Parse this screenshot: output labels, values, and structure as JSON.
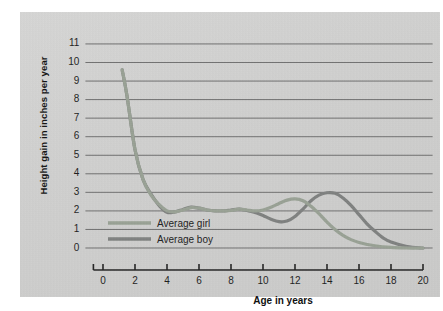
{
  "chart_data": {
    "type": "line",
    "title": "",
    "xlabel": "Age in years",
    "ylabel": "Height gain in inches per year",
    "xlim": [
      -1,
      20
    ],
    "ylim": [
      0,
      11
    ],
    "xticks": [
      "0",
      "2",
      "4",
      "6",
      "8",
      "10",
      "12",
      "14",
      "16",
      "18",
      "20"
    ],
    "yticks": [
      "0",
      "1",
      "2",
      "3",
      "4",
      "5",
      "6",
      "7",
      "8",
      "9",
      "10",
      "11"
    ],
    "grid": "horizontal",
    "legend_position": "inside-lower-left",
    "series": [
      {
        "name": "Average girl",
        "color": "#97a093",
        "x": [
          1.2,
          1.5,
          2.0,
          2.5,
          3.0,
          3.5,
          4.0,
          4.5,
          5.0,
          5.5,
          6.0,
          6.5,
          7.0,
          7.5,
          8.0,
          8.5,
          9.0,
          9.5,
          10.0,
          10.5,
          11.0,
          11.5,
          12.0,
          12.5,
          13.0,
          13.5,
          14.0,
          14.5,
          15.0,
          15.5,
          16.0,
          17.0,
          18.0,
          19.0,
          20.0
        ],
        "values": [
          9.6,
          8.2,
          5.3,
          3.7,
          2.85,
          2.35,
          2.0,
          1.95,
          2.05,
          2.18,
          2.15,
          2.05,
          2.0,
          2.0,
          2.02,
          2.1,
          2.05,
          2.0,
          2.05,
          2.2,
          2.4,
          2.58,
          2.65,
          2.55,
          2.25,
          1.85,
          1.4,
          1.0,
          0.68,
          0.45,
          0.3,
          0.12,
          0.03,
          0.0,
          0.0
        ]
      },
      {
        "name": "Average boy",
        "color": "#7d7f7e",
        "x": [
          1.2,
          1.5,
          2.0,
          2.5,
          3.0,
          3.5,
          4.0,
          4.5,
          5.0,
          5.5,
          6.0,
          6.5,
          7.0,
          7.5,
          8.0,
          8.5,
          9.0,
          9.5,
          10.0,
          10.5,
          11.0,
          11.5,
          12.0,
          12.5,
          13.0,
          13.5,
          14.0,
          14.5,
          15.0,
          15.5,
          16.0,
          16.5,
          17.0,
          17.5,
          18.0,
          19.0,
          20.0
        ],
        "values": [
          9.6,
          8.2,
          5.3,
          3.7,
          2.9,
          2.3,
          1.92,
          1.95,
          2.08,
          2.2,
          2.15,
          2.05,
          2.0,
          2.0,
          2.05,
          2.1,
          2.02,
          1.92,
          1.75,
          1.55,
          1.42,
          1.45,
          1.7,
          2.1,
          2.55,
          2.85,
          2.98,
          2.95,
          2.7,
          2.3,
          1.8,
          1.3,
          0.9,
          0.55,
          0.32,
          0.08,
          0.0
        ]
      }
    ],
    "annotations": {
      "girl_peak_age": 12.0,
      "girl_peak_value": 2.65,
      "boy_peak_age": 14.0,
      "boy_peak_value": 2.98,
      "infancy_start_value": 9.6
    }
  },
  "legend": {
    "girl": "Average girl",
    "boy": "Average boy"
  },
  "axes": {
    "x_title": "Age in years",
    "y_title": "Height gain in inches per year"
  },
  "colors": {
    "girl_line": "#97a093",
    "boy_line": "#7d7f7e",
    "grid": "#6e6e6e",
    "panel_background": "#d0d0cf",
    "text": "#111111"
  }
}
